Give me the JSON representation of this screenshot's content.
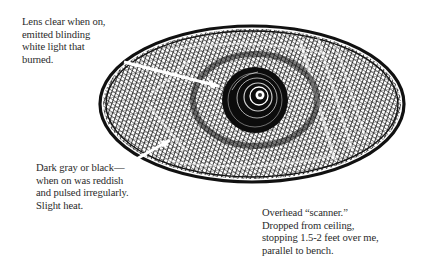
{
  "diagram": {
    "style": "pen-and-ink crosshatched ellipse",
    "colors": {
      "ink": "#111111",
      "paper": "#ffffff",
      "text": "#2a2a2a",
      "leader": "#ffffff"
    },
    "shape": {
      "type": "ellipse",
      "cx": 252,
      "cy": 104,
      "rx": 152,
      "ry": 78
    },
    "lens": {
      "cx": 255,
      "cy": 100,
      "r": 32
    }
  },
  "annotations": [
    {
      "id": "lens",
      "target": "center lens",
      "lines": [
        "Lens clear when on,",
        "emitted blinding",
        "white light that",
        "burned."
      ]
    },
    {
      "id": "body",
      "target": "outer body",
      "lines": [
        "Dark gray or black—",
        "when on was reddish",
        "and pulsed irregularly.",
        "Slight heat."
      ]
    },
    {
      "id": "overall",
      "target": "whole object",
      "lines": [
        "Overhead “scanner.”",
        "Dropped from ceiling,",
        "stopping 1.5-2 feet over me,",
        "parallel to bench."
      ]
    }
  ]
}
